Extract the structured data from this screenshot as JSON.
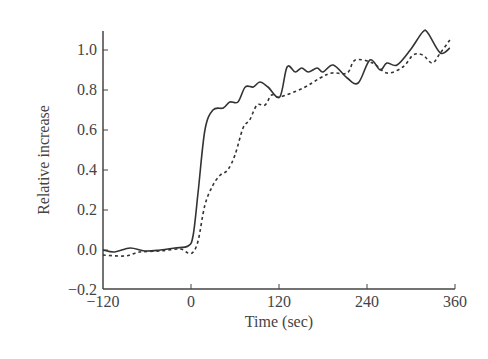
{
  "chart_data": {
    "type": "line",
    "title": "",
    "xlabel": "Time (sec)",
    "ylabel": "Relative increase",
    "xlim": [
      -120,
      360
    ],
    "ylim": [
      -0.2,
      1.1
    ],
    "xticks": [
      -120,
      0,
      120,
      240,
      360
    ],
    "xtick_labels": [
      "−120",
      "0",
      "120",
      "240",
      "360"
    ],
    "yticks": [
      -0.2,
      0.0,
      0.2,
      0.4,
      0.6,
      0.8,
      1.0
    ],
    "ytick_labels": [
      "−0.2",
      "0.0",
      "0.2",
      "0.4",
      "0.6",
      "0.8",
      "1.0"
    ],
    "grid": false,
    "legend": null,
    "series": [
      {
        "name": "solid",
        "style": "solid",
        "color": "#333333",
        "x": [
          -120,
          -104,
          -83,
          -63,
          -42,
          -22,
          -4,
          3,
          10,
          19,
          30,
          44,
          53,
          64,
          74,
          85,
          94,
          105,
          121,
          131,
          142,
          151,
          160,
          172,
          180,
          194,
          213,
          228,
          244,
          258,
          267,
          281,
          299,
          316,
          323,
          340,
          353
        ],
        "y": [
          0.0,
          -0.01,
          0.01,
          -0.005,
          0.0,
          0.01,
          0.02,
          0.075,
          0.3,
          0.6,
          0.7,
          0.71,
          0.74,
          0.74,
          0.815,
          0.815,
          0.84,
          0.815,
          0.765,
          0.915,
          0.89,
          0.91,
          0.89,
          0.91,
          0.89,
          0.925,
          0.86,
          0.835,
          0.95,
          0.9,
          0.935,
          0.925,
          1.0,
          1.09,
          1.085,
          0.985,
          1.01
        ]
      },
      {
        "name": "dashed",
        "style": "dashed",
        "color": "#333333",
        "x": [
          -120,
          -90,
          -70,
          -42,
          -15,
          -4,
          3,
          10,
          19,
          30,
          40,
          50,
          60,
          71,
          80,
          90,
          101,
          110,
          121,
          153,
          176,
          192,
          213,
          224,
          248,
          267,
          289,
          303,
          316,
          329,
          340,
          353
        ],
        "y": [
          -0.025,
          -0.03,
          -0.01,
          -0.005,
          0.005,
          -0.015,
          -0.01,
          0.05,
          0.225,
          0.325,
          0.375,
          0.4,
          0.475,
          0.61,
          0.65,
          0.725,
          0.725,
          0.775,
          0.765,
          0.81,
          0.86,
          0.885,
          0.885,
          0.95,
          0.935,
          0.885,
          0.915,
          0.975,
          0.975,
          0.935,
          0.985,
          1.05
        ]
      }
    ]
  }
}
